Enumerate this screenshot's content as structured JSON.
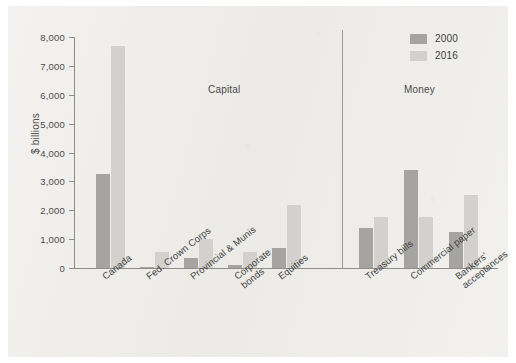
{
  "chart_data": {
    "type": "bar",
    "title": "",
    "xlabel": "",
    "ylabel": "$ billions",
    "ylim": [
      0,
      8000
    ],
    "ytick_labels": [
      "0",
      "1,000",
      "2,000",
      "3,000",
      "4,000",
      "5,000",
      "6,000",
      "7,000",
      "8,000"
    ],
    "ytick_values": [
      0,
      1000,
      2000,
      3000,
      4000,
      5000,
      6000,
      7000,
      8000
    ],
    "grid": false,
    "legend_position": "top-right",
    "categories": [
      "Canada",
      "Fed. Crown Corps",
      "Provincial & Munis",
      "Corporate\nbonds",
      "Equities",
      "Treasury bills",
      "Commercial paper",
      "Bankers'\nacceptances"
    ],
    "series": [
      {
        "name": "2000",
        "color": "#a5a4a1",
        "values": [
          3250,
          40,
          350,
          120,
          690,
          1370,
          3380,
          1230
        ]
      },
      {
        "name": "2016",
        "color": "#d2d1ce",
        "values": [
          7680,
          550,
          1020,
          570,
          2180,
          1780,
          1780,
          2530
        ]
      }
    ],
    "sections": [
      {
        "label": "Capital",
        "categories": [
          "Canada",
          "Fed. Crown Corps",
          "Provincial & Munis",
          "Corporate bonds",
          "Equities"
        ]
      },
      {
        "label": "Money",
        "categories": [
          "Treasury bills",
          "Commercial paper",
          "Bankers' acceptances"
        ]
      }
    ]
  },
  "legend": {
    "items": [
      {
        "label": "2000"
      },
      {
        "label": "2016"
      }
    ]
  },
  "axis": {
    "y_title": "$ billions"
  },
  "sections": {
    "capital": "Capital",
    "money": "Money"
  }
}
